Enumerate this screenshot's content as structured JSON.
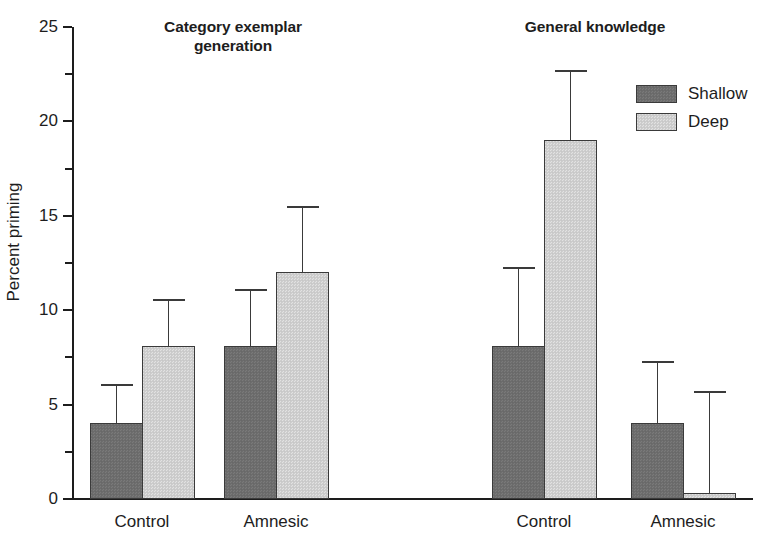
{
  "axis": {
    "y_title": "Percent priming",
    "y_ticks": [
      "0",
      "5",
      "10",
      "15",
      "20",
      "25"
    ]
  },
  "panels": [
    {
      "title": "Category exemplar generation",
      "groups": [
        "Control",
        "Amnesic"
      ]
    },
    {
      "title": "General knowledge",
      "groups": [
        "Control",
        "Amnesic"
      ]
    }
  ],
  "legend": {
    "items": [
      {
        "label": "Shallow",
        "color": "#6e6e6e"
      },
      {
        "label": "Deep",
        "color": "#cfcfcf"
      }
    ]
  },
  "chart_data": {
    "type": "bar",
    "title": "",
    "xlabel": "",
    "ylabel": "Percent priming",
    "ylim": [
      0,
      25
    ],
    "y_major_tick_step": 5,
    "y_minor_tick_step": 2.5,
    "grid": false,
    "legend_position": "top-right",
    "panels": [
      {
        "panel_title": "Category exemplar generation",
        "categories": [
          "Control",
          "Amnesic"
        ],
        "series": [
          {
            "name": "Shallow",
            "values": [
              4.0,
              8.1
            ],
            "errors_upper": [
              6.1,
              11.1
            ]
          },
          {
            "name": "Deep",
            "values": [
              8.1,
              12.0
            ],
            "errors_upper": [
              10.6,
              15.5
            ]
          }
        ]
      },
      {
        "panel_title": "General knowledge",
        "categories": [
          "Control",
          "Amnesic"
        ],
        "series": [
          {
            "name": "Shallow",
            "values": [
              8.1,
              4.0
            ],
            "errors_upper": [
              12.3,
              7.3
            ]
          },
          {
            "name": "Deep",
            "values": [
              19.0,
              0.3
            ],
            "errors_upper": [
              22.7,
              5.7
            ]
          }
        ]
      }
    ]
  },
  "geometry": {
    "y_zero_px": 499,
    "y_top_px": 27,
    "px_per_unit": 18.88,
    "bar_width_px": 53,
    "bars": [
      {
        "name": "left-control-shallow",
        "panel": 0,
        "group": 0,
        "series": "Shallow",
        "left": 90,
        "value": 4.0,
        "err_top": 6.1
      },
      {
        "name": "left-control-deep",
        "panel": 0,
        "group": 0,
        "series": "Deep",
        "left": 142,
        "value": 8.1,
        "err_top": 10.6
      },
      {
        "name": "left-amnesic-shallow",
        "panel": 0,
        "group": 1,
        "series": "Shallow",
        "left": 224,
        "value": 8.1,
        "err_top": 11.1
      },
      {
        "name": "left-amnesic-deep",
        "panel": 0,
        "group": 1,
        "series": "Deep",
        "left": 276,
        "value": 12.0,
        "err_top": 15.5
      },
      {
        "name": "right-control-shallow",
        "panel": 1,
        "group": 0,
        "series": "Shallow",
        "left": 492,
        "value": 8.1,
        "err_top": 12.3
      },
      {
        "name": "right-control-deep",
        "panel": 1,
        "group": 0,
        "series": "Deep",
        "left": 544,
        "value": 19.0,
        "err_top": 22.7
      },
      {
        "name": "right-amnesic-shallow",
        "panel": 1,
        "group": 1,
        "series": "Shallow",
        "left": 631,
        "value": 4.0,
        "err_top": 7.3
      },
      {
        "name": "right-amnesic-deep",
        "panel": 1,
        "group": 1,
        "series": "Deep",
        "left": 683,
        "value": 0.3,
        "err_top": 5.7
      }
    ],
    "group_labels": [
      {
        "text": "Control",
        "center": 142
      },
      {
        "text": "Amnesic",
        "center": 276
      },
      {
        "text": "Control",
        "center": 544
      },
      {
        "text": "Amnesic",
        "center": 683
      }
    ]
  }
}
